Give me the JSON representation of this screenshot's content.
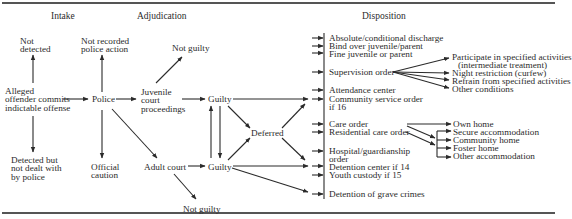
{
  "headers": {
    "intake": "Intake",
    "adjudication": "Adjudication",
    "disposition": "Disposition"
  },
  "intake": {
    "not_detected": [
      "Not",
      "detected"
    ],
    "alleged": [
      "Alleged",
      "offender commits",
      "indictable offense"
    ],
    "detected_not_dealt": [
      "Detected but",
      "not dealt with",
      "by police"
    ]
  },
  "police": {
    "not_recorded": [
      "Not recorded",
      "police action"
    ],
    "police": "Police",
    "official_caution": [
      "Official",
      "caution"
    ]
  },
  "adjudication": {
    "juvenile_court": [
      "Juvenile",
      "court",
      "proceedings"
    ],
    "adult_court": "Adult court",
    "not_guilty_top": "Not guilty",
    "not_guilty_bottom": "Not guilty",
    "guilty_top": "Guilty",
    "guilty_bottom": "Guilty",
    "deferred": "Deferred"
  },
  "disposition": {
    "items": [
      "Absolute/conditional discharge",
      "Bind over juvenile/parent",
      "Fine juvenile or parent",
      "Supervision order",
      "Attendance center",
      "Community service order",
      "if 16",
      "Care order",
      "Residential care order",
      "Hospital/guardianship",
      "order",
      "Detention center if 14",
      "Youth custody if 15",
      "Detention of grave crimes"
    ]
  },
  "supervision_conditions": [
    "Participate in specified activities",
    "(intermediate treatment)",
    "Night restriction (curfew)",
    "Refrain from specified activities",
    "Other conditions"
  ],
  "care_placements": [
    "Own home",
    "Secure accommodation",
    "Community home",
    "Foster home",
    "Other accommodation"
  ],
  "colors": {
    "line": "#2a2a2a",
    "rule": "#555555",
    "background": "#ffffff"
  }
}
